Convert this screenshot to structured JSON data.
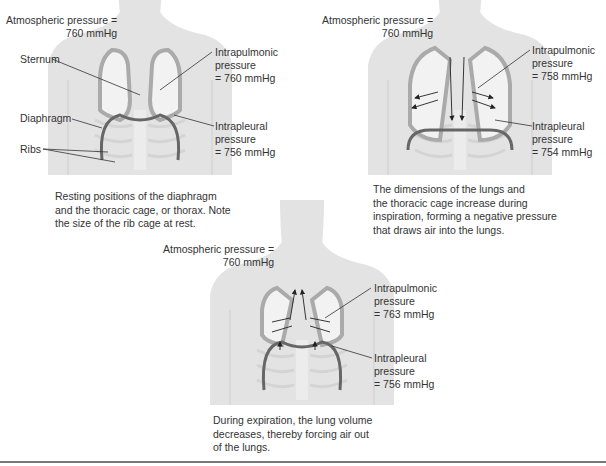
{
  "panels": [
    {
      "id": "rest",
      "atmospheric_line1": "Atmospheric pressure =",
      "atmospheric_line2": "760 mmHg",
      "intrapulmonic": [
        "Intrapulmonic",
        "pressure",
        "= 760 mmHg"
      ],
      "intrapleural": [
        "Intrapleural",
        "pressure",
        "= 756 mmHg"
      ],
      "labels": {
        "sternum": "Sternum",
        "diaphragm": "Diaphragm",
        "ribs": "Ribs"
      },
      "caption": [
        "Resting positions of the diaphragm",
        "and the thoracic cage, or thorax. Note",
        "the size of the rib cage at rest."
      ]
    },
    {
      "id": "inspiration",
      "atmospheric_line1": "Atmospheric pressure =",
      "atmospheric_line2": "760 mmHg",
      "intrapulmonic": [
        "Intrapulmonic",
        "pressure",
        "= 758 mmHg"
      ],
      "intrapleural": [
        "Intrapleural",
        "pressure",
        "= 754 mmHg"
      ],
      "caption": [
        "The dimensions of the lungs and",
        "the thoracic cage increase during",
        "inspiration, forming a negative pressure",
        "that draws air into the lungs."
      ]
    },
    {
      "id": "expiration",
      "atmospheric_line1": "Atmospheric pressure =",
      "atmospheric_line2": "760 mmHg",
      "intrapulmonic": [
        "Intrapulmonic",
        "pressure",
        "= 763 mmHg"
      ],
      "intrapleural": [
        "Intrapleural",
        "pressure",
        "= 756 mmHg"
      ],
      "caption": [
        "During expiration, the lung volume",
        "decreases, thereby forcing air out",
        "of the lungs."
      ]
    }
  ],
  "colors": {
    "body": "#e3e3e3",
    "lung_wall": "#c8c8c8",
    "lung_inner": "#f2f2f2",
    "diaphragm": "#666666",
    "line": "#333333"
  }
}
